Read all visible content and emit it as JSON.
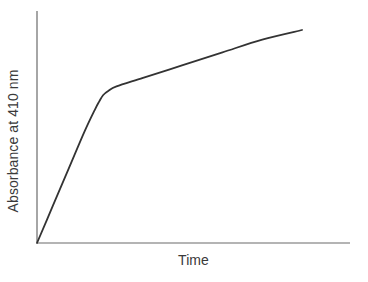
{
  "chart_data": {
    "type": "line",
    "title": "",
    "subtitle": "",
    "xlabel": "Time",
    "ylabel": "Absorbance at 410 nm",
    "xtick_labels": [],
    "ytick_labels": [],
    "grid": false,
    "legend": false,
    "legend_position": "none",
    "xlim": [
      0,
      1
    ],
    "ylim": [
      0,
      1
    ],
    "axes_style": "left-and-bottom-spines-only",
    "annotations": [],
    "series": [
      {
        "name": "Absorbance progress curve",
        "description": "Biphasic curve: steep initial linear rise, rounded transition, then shallower linear rise",
        "color": "#333333",
        "line_width": 1.8,
        "x": [
          0.0,
          0.06,
          0.12,
          0.18,
          0.22,
          0.235,
          0.25,
          0.27,
          0.3,
          0.4,
          0.55,
          0.7,
          0.85,
          1.0
        ],
        "y": [
          0.0,
          0.175,
          0.35,
          0.525,
          0.63,
          0.665,
          0.695,
          0.715,
          0.735,
          0.775,
          0.835,
          0.895,
          0.955,
          1.0
        ]
      }
    ]
  },
  "axes": {
    "y_axis_name": "y-axis-spine",
    "x_axis_name": "x-axis-spine",
    "color": "#6b6b6b"
  },
  "colors": {
    "background": "#ffffff",
    "curve": "#333333",
    "axis": "#6b6b6b",
    "text": "#3a3a3a"
  }
}
